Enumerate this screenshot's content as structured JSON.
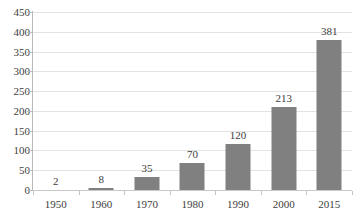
{
  "chart_data": {
    "type": "bar",
    "title": "",
    "subtitle": "",
    "xlabel": "",
    "ylabel": "",
    "categories": [
      "1950",
      "1960",
      "1970",
      "1980",
      "1990",
      "2000",
      "2015"
    ],
    "values": [
      2,
      8,
      35,
      70,
      120,
      213,
      381
    ],
    "data_labels": [
      "2",
      "8",
      "35",
      "70",
      "120",
      "213",
      "381"
    ],
    "ylim": [
      0,
      450
    ],
    "yticks": [
      0,
      50,
      100,
      150,
      200,
      250,
      300,
      350,
      400,
      450
    ],
    "ytick_labels": [
      "0",
      "50",
      "100",
      "150",
      "200",
      "250",
      "300",
      "350",
      "400",
      "450"
    ],
    "grid": true,
    "grid_axis": "y",
    "legend": false,
    "legend_position": "none",
    "series": [
      {
        "name": "",
        "values": [
          2,
          8,
          35,
          70,
          120,
          213,
          381
        ],
        "color": "#808080"
      }
    ],
    "colors": {
      "bar": "#808080",
      "gridline": "#e3e3e3",
      "axis": "#b9b9b9",
      "text": "#3d3d3d",
      "background": "#ffffff"
    }
  }
}
